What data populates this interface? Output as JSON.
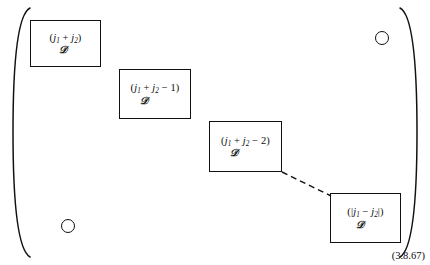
{
  "figure": {
    "kind": "block-diagonal-matrix",
    "equation_number": "(3.8.67)",
    "bracket": {
      "left": "(",
      "right": ")"
    },
    "blocks": [
      {
        "id": "block-1",
        "label": "(j₁ + j₂)",
        "label_parts": {
          "open": "(",
          "a": "j",
          "a_sub": "1",
          "op": " + ",
          "b": "j",
          "b_sub": "2",
          "tail": "",
          "close": ")"
        },
        "symbol": "𝒟",
        "symbol_name": "script-D",
        "x": 30,
        "y": 20,
        "w": 71,
        "h": 47
      },
      {
        "id": "block-2",
        "label": "(j₁ + j₂ − 1)",
        "label_parts": {
          "open": "(",
          "a": "j",
          "a_sub": "1",
          "op": " + ",
          "b": "j",
          "b_sub": "2",
          "tail": " − 1",
          "close": ")"
        },
        "symbol": "𝒟",
        "symbol_name": "script-D",
        "x": 119,
        "y": 69,
        "w": 72,
        "h": 50
      },
      {
        "id": "block-3",
        "label": "(j₁ + j₂ − 2)",
        "label_parts": {
          "open": "(",
          "a": "j",
          "a_sub": "1",
          "op": " + ",
          "b": "j",
          "b_sub": "2",
          "tail": " − 2",
          "close": ")"
        },
        "symbol": "𝒟",
        "symbol_name": "script-D",
        "x": 209,
        "y": 121,
        "w": 73,
        "h": 51
      },
      {
        "id": "block-4",
        "label": "(|j₁ − j₂|)",
        "label_parts": {
          "open": "(|",
          "a": "j",
          "a_sub": "1",
          "op": " − ",
          "b": "j",
          "b_sub": "2",
          "tail": "",
          "close": "|)"
        },
        "symbol": "𝒟",
        "symbol_name": "script-D",
        "x": 330,
        "y": 193,
        "w": 71,
        "h": 50
      }
    ],
    "ellipsis_dots": [
      {
        "id": "dot-top-right",
        "cx": 382,
        "cy": 38,
        "r": 7
      },
      {
        "id": "dot-bottom-left",
        "cx": 68,
        "cy": 226,
        "r": 7
      }
    ],
    "connector": {
      "id": "dashed-connector",
      "style": "dashed",
      "from_x": 282,
      "from_y": 172,
      "to_x": 330,
      "to_y": 196
    },
    "colors": {
      "ink": "#111111",
      "background": "#ffffff"
    }
  }
}
